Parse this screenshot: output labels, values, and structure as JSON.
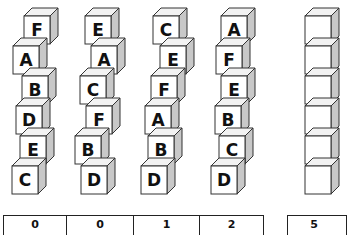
{
  "columns": [
    {
      "id": "col1",
      "blocks": [
        {
          "letter": "F",
          "x": 24,
          "y": 8
        },
        {
          "letter": "A",
          "x": 13,
          "y": 38
        },
        {
          "letter": "B",
          "x": 22,
          "y": 68
        },
        {
          "letter": "D",
          "x": 16,
          "y": 98
        },
        {
          "letter": "E",
          "x": 20,
          "y": 128
        },
        {
          "letter": "C",
          "x": 12,
          "y": 158
        }
      ],
      "score": "0"
    },
    {
      "id": "col2",
      "blocks": [
        {
          "letter": "E",
          "x": 85,
          "y": 8
        },
        {
          "letter": "A",
          "x": 91,
          "y": 38
        },
        {
          "letter": "C",
          "x": 80,
          "y": 68
        },
        {
          "letter": "F",
          "x": 86,
          "y": 98
        },
        {
          "letter": "B",
          "x": 75,
          "y": 128
        },
        {
          "letter": "D",
          "x": 81,
          "y": 158
        }
      ],
      "score": "0"
    },
    {
      "id": "col3",
      "blocks": [
        {
          "letter": "C",
          "x": 153,
          "y": 8
        },
        {
          "letter": "E",
          "x": 160,
          "y": 38
        },
        {
          "letter": "F",
          "x": 151,
          "y": 68
        },
        {
          "letter": "A",
          "x": 145,
          "y": 98
        },
        {
          "letter": "B",
          "x": 148,
          "y": 128
        },
        {
          "letter": "D",
          "x": 141,
          "y": 158
        }
      ],
      "score": "1"
    },
    {
      "id": "col4",
      "blocks": [
        {
          "letter": "A",
          "x": 221,
          "y": 8
        },
        {
          "letter": "F",
          "x": 216,
          "y": 38
        },
        {
          "letter": "E",
          "x": 221,
          "y": 68
        },
        {
          "letter": "B",
          "x": 215,
          "y": 98
        },
        {
          "letter": "C",
          "x": 219,
          "y": 128
        },
        {
          "letter": "D",
          "x": 211,
          "y": 158
        }
      ],
      "score": "2"
    },
    {
      "id": "col5",
      "blocks": [
        {
          "letter": "",
          "x": 305,
          "y": 8
        },
        {
          "letter": "",
          "x": 305,
          "y": 38
        },
        {
          "letter": "",
          "x": 305,
          "y": 68
        },
        {
          "letter": "",
          "x": 305,
          "y": 98
        },
        {
          "letter": "",
          "x": 305,
          "y": 128
        },
        {
          "letter": "",
          "x": 305,
          "y": 158
        }
      ],
      "score": "5"
    }
  ],
  "score_table": {
    "cells": [
      "0",
      "0",
      "1",
      "2"
    ]
  },
  "score_box": {
    "value": "5"
  },
  "colors": {
    "face": "#ffffff",
    "top": "#f2f2f2",
    "side": "#c8c8c8",
    "stroke": "#333333"
  }
}
